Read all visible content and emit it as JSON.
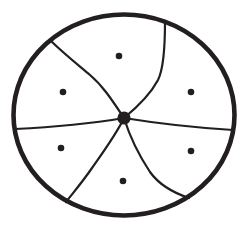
{
  "figure": {
    "background_color": "#ffffff",
    "ink_color": "#231f20",
    "canvas": {
      "width": 246,
      "height": 233
    },
    "outer_circle": {
      "cx": 124,
      "cy": 115,
      "rx": 110.5,
      "ry": 100.5,
      "stroke_width": 4.6
    },
    "center_dot": {
      "cx": 124,
      "cy": 118,
      "r": 6.6
    },
    "divider_curves": [
      {
        "name": "divider-upper-left",
        "path": "M124,118 C112,100 103,86 90,75 C77,64 62,52 50,40"
      },
      {
        "name": "divider-top",
        "path": "M124,118 C135,109 150,95 158,80 C164,68 165,45 165,22"
      },
      {
        "name": "divider-left",
        "path": "M124,118 C100,122 55,127 15,129"
      },
      {
        "name": "divider-right",
        "path": "M124,118 C155,123 200,128 233,130"
      },
      {
        "name": "divider-lower-left",
        "path": "M124,118 C117,133 104,151 92,168 C81,184 72,194 66,202"
      },
      {
        "name": "divider-lower-right",
        "path": "M124,118 C129,134 138,154 150,172 C160,186 174,193 189,198"
      }
    ],
    "curve_stroke_width": 2.2,
    "region_dots": [
      {
        "name": "region-dot-top",
        "cx": 119,
        "cy": 56,
        "r": 3.3
      },
      {
        "name": "region-dot-upper-left",
        "cx": 63,
        "cy": 92,
        "r": 3.3
      },
      {
        "name": "region-dot-upper-right",
        "cx": 191,
        "cy": 92,
        "r": 3.3
      },
      {
        "name": "region-dot-lower-left",
        "cx": 61,
        "cy": 148,
        "r": 3.3
      },
      {
        "name": "region-dot-lower-right",
        "cx": 191,
        "cy": 151,
        "r": 3.3
      },
      {
        "name": "region-dot-bottom",
        "cx": 123,
        "cy": 181,
        "r": 3.3
      }
    ]
  }
}
